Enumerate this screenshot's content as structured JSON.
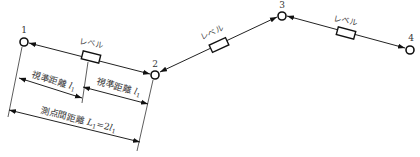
{
  "diagram": {
    "type": "leveling-survey-route",
    "points": [
      {
        "id": "1",
        "label": "1"
      },
      {
        "id": "2",
        "label": "2"
      },
      {
        "id": "3",
        "label": "3"
      },
      {
        "id": "4",
        "label": "4"
      }
    ],
    "instruments": [
      {
        "between": [
          "1",
          "2"
        ],
        "label": "レベル"
      },
      {
        "between": [
          "2",
          "3"
        ],
        "label": "レベル"
      },
      {
        "between": [
          "3",
          "4"
        ],
        "label": "レベル"
      }
    ],
    "dimensions": {
      "sight_distance_1": {
        "text": "視準距離 ",
        "var": "l",
        "sub": "1"
      },
      "sight_distance_2": {
        "text": "視準距離 ",
        "var": "l",
        "sub": "1"
      },
      "station_distance": {
        "text": "測点間距離 ",
        "var": "L",
        "sub": "1",
        "eq": "=2",
        "var2": "l",
        "sub2": "1"
      }
    }
  }
}
